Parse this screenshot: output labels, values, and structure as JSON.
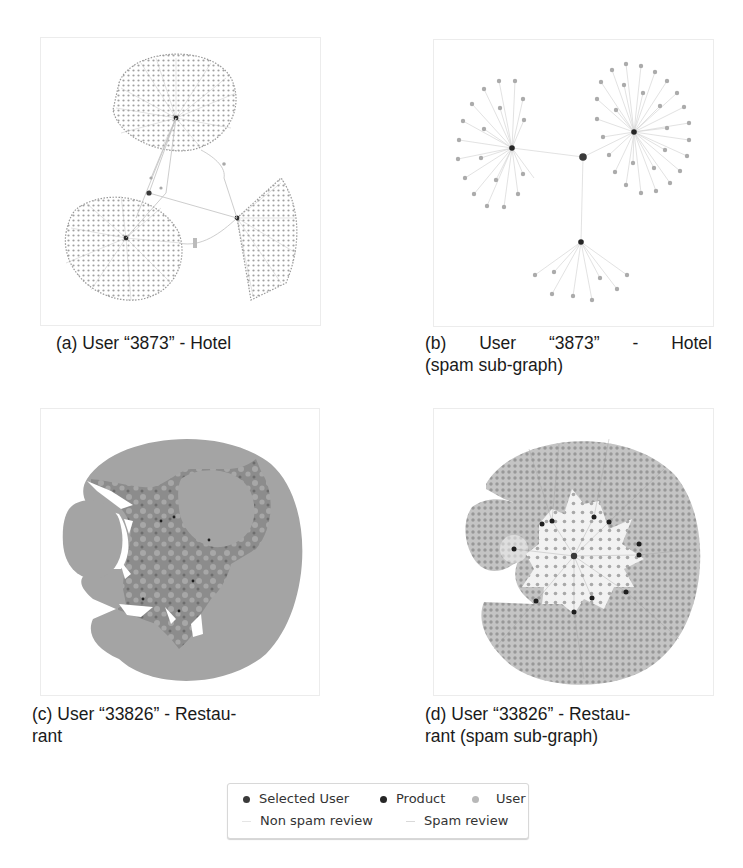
{
  "figure": {
    "panels": [
      {
        "id": "a",
        "caption": "(a) User “3873” - Hotel",
        "caption_line2": "",
        "description": "Full review graph: three product hubs with large fans of user nodes"
      },
      {
        "id": "b",
        "caption": "(b) User “3873” - Hotel",
        "caption_line2": "(spam sub-graph)",
        "description": "Spam sub-graph: selected user connected to three products, each with spam-reviewing users"
      },
      {
        "id": "c",
        "caption": "(c) User “33826” - Restau-",
        "caption_line2": "rant",
        "description": "Full review graph: dense circular mass of user nodes around product hubs"
      },
      {
        "id": "d",
        "caption": "(d) User “33826” - Restau-",
        "caption_line2": "rant (spam sub-graph)",
        "description": "Spam sub-graph: selected user at center with many product hubs and user fans"
      }
    ],
    "legend": {
      "items": [
        {
          "label": "Selected User",
          "type": "node",
          "color": "#3a3a3a"
        },
        {
          "label": "Product",
          "type": "node",
          "color": "#262626"
        },
        {
          "label": "User",
          "type": "node",
          "color": "#b8b8b8"
        },
        {
          "label": "Non spam review",
          "type": "edge",
          "color": "#e6e6e6"
        },
        {
          "label": "Spam review",
          "type": "edge",
          "color": "#d9d9d9"
        }
      ]
    }
  },
  "colors": {
    "user_node": "#a9a9a9",
    "product_node": "#2a2a2a",
    "selected_user": "#3a3a3a",
    "edge": "#c9c9c9",
    "dense_fill": "#a3a3a3",
    "dense_dark": "#5a5a5a"
  }
}
